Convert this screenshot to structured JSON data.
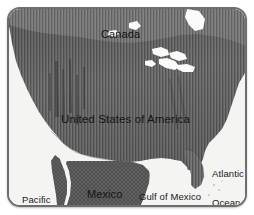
{
  "figure": {
    "kind": "reference-map",
    "subject": "United States of America",
    "frame": {
      "border_color": "#6e6e6e",
      "corner_radius_px": 13,
      "width_px": 240,
      "height_px": 200
    }
  },
  "palette": {
    "ocean": "#f4f4f2",
    "land_stripe_dark": "#5a5a5a",
    "land_stripe_light": "#7c7c7c",
    "canada_fill": "#6f6f6f",
    "mexico_fill": "#5d5d5d",
    "lakes": "#fbfbfa",
    "label_text": "#161616",
    "frame_border": "#6e6e6e"
  },
  "labels": {
    "canada": "Canada",
    "united_states": "United States of America",
    "mexico": "Mexico",
    "gulf_of_mexico": "Gulf of Mexico",
    "atlantic_ocean": {
      "line1": "Atlantic",
      "line2": "Ocean"
    },
    "pacific_ocean": {
      "line1": "Pacific",
      "line2": "Ocean"
    }
  },
  "features": {
    "water_bodies": [
      "Pacific Ocean",
      "Atlantic Ocean",
      "Gulf of Mexico",
      "Great Lakes",
      "Hudson Bay"
    ],
    "countries": [
      "Canada",
      "United States of America",
      "Mexico"
    ],
    "landmarks": [
      "Baja California peninsula",
      "Florida peninsula",
      "Great Lakes"
    ]
  },
  "texture": {
    "united_states": "vertical-hatch",
    "canada": "vertical-hatch",
    "mexico": "dot-hatch",
    "stripe_period_px": 3
  }
}
